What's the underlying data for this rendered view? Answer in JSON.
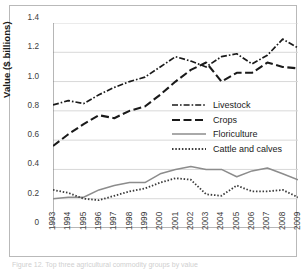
{
  "figure": {
    "background": "#ffffff",
    "frame_color": "#b9b9b9",
    "caption_partial": "Figure 12. Top three agricultural commodity groups by value"
  },
  "chart_data": {
    "type": "line",
    "title": "",
    "xlabel": "",
    "ylabel": "Value ($ billions)",
    "x": [
      1993,
      1994,
      1995,
      1996,
      1997,
      1998,
      1999,
      2000,
      2001,
      2002,
      2003,
      2004,
      2005,
      2006,
      2007,
      2008,
      2009
    ],
    "xtick_labels": [
      "1993",
      "1994",
      "1995",
      "1996",
      "1997",
      "1998",
      "1999",
      "2000",
      "2001",
      "2002",
      "2003",
      "2004",
      "2005",
      "2006",
      "2007",
      "2008",
      "2009"
    ],
    "ytick_labels": [
      "0",
      "0.2",
      "0.4",
      "0.6",
      "0.8",
      "1.0",
      "1.2",
      "1.4"
    ],
    "ytick_values": [
      0,
      0.2,
      0.4,
      0.6,
      0.8,
      1.0,
      1.2,
      1.4
    ],
    "ylim": [
      0,
      1.4
    ],
    "grid": "horizontal",
    "legend_position": "center-right",
    "series": [
      {
        "name": "Livestock",
        "style": "dash-dot",
        "color": "#1a1a1a",
        "values": [
          0.84,
          0.87,
          0.85,
          0.91,
          0.96,
          1.0,
          1.03,
          1.1,
          1.17,
          1.14,
          1.1,
          1.17,
          1.19,
          1.12,
          1.18,
          1.29,
          1.23
        ]
      },
      {
        "name": "Crops",
        "style": "dashed",
        "color": "#1a1a1a",
        "values": [
          0.56,
          0.64,
          0.71,
          0.77,
          0.75,
          0.8,
          0.83,
          0.91,
          1.0,
          1.08,
          1.13,
          1.0,
          1.06,
          1.06,
          1.13,
          1.1,
          1.09
        ]
      },
      {
        "name": "Floriculture",
        "style": "solid",
        "color": "#8c8c8c",
        "values": [
          0.2,
          0.21,
          0.21,
          0.26,
          0.29,
          0.31,
          0.31,
          0.37,
          0.4,
          0.42,
          0.4,
          0.4,
          0.35,
          0.39,
          0.41,
          0.37,
          0.33
        ]
      },
      {
        "name": "Cattle and calves",
        "style": "dotted",
        "color": "#3a3a3a",
        "values": [
          0.26,
          0.24,
          0.2,
          0.19,
          0.22,
          0.25,
          0.27,
          0.31,
          0.34,
          0.33,
          0.23,
          0.22,
          0.29,
          0.25,
          0.25,
          0.26,
          0.21
        ]
      }
    ]
  }
}
